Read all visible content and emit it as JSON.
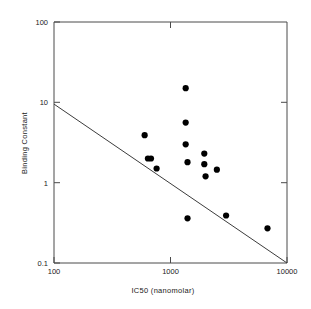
{
  "chart_data": {
    "type": "scatter",
    "title": "",
    "xlabel": "IC50 (nanomolar)",
    "ylabel": "Binding Constant",
    "xscale": "log",
    "yscale": "log",
    "xlim": [
      100,
      10000
    ],
    "ylim": [
      0.1,
      100
    ],
    "xticks": [
      100,
      1000,
      10000
    ],
    "xtick_labels": [
      "100",
      "1000",
      "10000"
    ],
    "yticks": [
      0.1,
      1,
      10,
      100
    ],
    "ytick_labels": [
      "0.1",
      "1",
      "10",
      "100"
    ],
    "grid": false,
    "legend": null,
    "series": [
      {
        "name": "compounds",
        "marker": "filled-circle",
        "color": "#000000",
        "points": [
          {
            "x": 600,
            "y": 3.9
          },
          {
            "x": 640,
            "y": 2.0
          },
          {
            "x": 680,
            "y": 2.0
          },
          {
            "x": 760,
            "y": 1.5
          },
          {
            "x": 1350,
            "y": 15.0
          },
          {
            "x": 1350,
            "y": 5.6
          },
          {
            "x": 1350,
            "y": 3.0
          },
          {
            "x": 1400,
            "y": 1.8
          },
          {
            "x": 1400,
            "y": 0.36
          },
          {
            "x": 1950,
            "y": 2.3
          },
          {
            "x": 1950,
            "y": 1.7
          },
          {
            "x": 2000,
            "y": 1.2
          },
          {
            "x": 2500,
            "y": 1.45
          },
          {
            "x": 3000,
            "y": 0.39
          },
          {
            "x": 6800,
            "y": 0.27
          }
        ]
      }
    ],
    "fit_line": {
      "name": "regression-line",
      "color": "#3c3c3c",
      "x_start": 100,
      "y_start": 9.5,
      "x_end": 10000,
      "y_end": 0.1
    }
  },
  "axes": {
    "x_title": "IC50 (nanomolar)",
    "y_title": "Binding Constant",
    "x_tick_labels": [
      "100",
      "1000",
      "10000"
    ],
    "y_tick_labels": [
      "100",
      "10",
      "1",
      "0.1"
    ]
  }
}
